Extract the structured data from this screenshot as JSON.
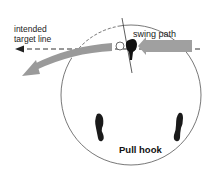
{
  "diagram": {
    "title": "Pull hook",
    "labels": {
      "target_line_1": "intended",
      "target_line_2": "target line",
      "swing_path": "swing path",
      "shot_name": "Pull hook"
    },
    "elements": {
      "target_line": "dashed-arrow-left",
      "swing_path_arrow": "gray-arrow-right-to-left",
      "ball_flight_arrow": "gray-curved-arrow-left",
      "clubhead": "black-clubhead",
      "ball": "ball-outline",
      "feet": [
        "left-foot",
        "right-foot"
      ],
      "circle": "stance-circle"
    },
    "colors": {
      "arrow_fill": "#9a9a9a",
      "ink": "#222222",
      "background": "#ffffff"
    }
  }
}
